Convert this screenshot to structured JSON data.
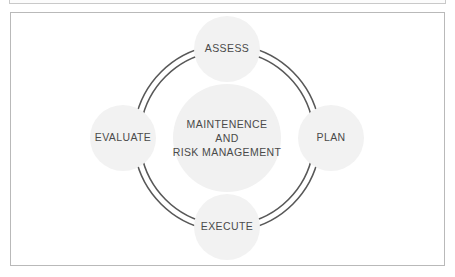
{
  "panel": {
    "background_color": "#ffffff",
    "border_color": "#b9b9b9"
  },
  "diagram": {
    "type": "cycle",
    "center": {
      "lines": [
        "MAINTENENCE",
        "AND",
        "RISK MANAGEMENT"
      ],
      "fill_color": "#f1f1f1"
    },
    "node_fill_color": "#f2f2f2",
    "ring_color": "#585858",
    "nodes": [
      {
        "id": "assess",
        "label": "ASSESS",
        "position": "top"
      },
      {
        "id": "plan",
        "label": "PLAN",
        "position": "right"
      },
      {
        "id": "execute",
        "label": "EXECUTE",
        "position": "bottom"
      },
      {
        "id": "evaluate",
        "label": "EVALUATE",
        "position": "left"
      }
    ]
  }
}
